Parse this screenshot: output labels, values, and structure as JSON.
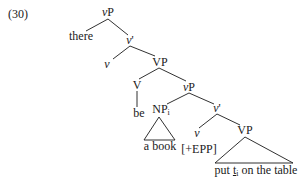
{
  "example": {
    "number": "(30)"
  },
  "tree": {
    "root": {
      "cat_prefix": "v",
      "cat_suffix": "P"
    },
    "spec_root": {
      "text": "there"
    },
    "vbar1": {
      "cat_prefix": "v",
      "cat_suffix": "'"
    },
    "v_head1": {
      "text": "v"
    },
    "vp1": {
      "text": "VP"
    },
    "V_head": {
      "text": "V"
    },
    "be": {
      "text": "be"
    },
    "vp_inner": {
      "cat_prefix": "v",
      "cat_suffix": "P"
    },
    "np": {
      "text": "NP",
      "index": "i"
    },
    "np_content": {
      "text": "a book"
    },
    "vbar2": {
      "cat_prefix": "v",
      "cat_suffix": "'"
    },
    "v_head2": {
      "text": "v"
    },
    "epp": {
      "text": "[+EPP]"
    },
    "vp2": {
      "text": "VP"
    },
    "vp2_content": {
      "before": "put ",
      "trace": "t",
      "trace_index": "i",
      "after": " on the table"
    }
  },
  "colors": {
    "ink": "#1a1a1a",
    "background": "#ffffff"
  }
}
